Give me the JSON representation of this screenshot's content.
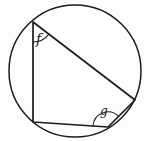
{
  "figure": {
    "colors": {
      "line": "#1c1c1c",
      "background": "#fdfdfd"
    },
    "circle": {
      "cx": 75,
      "cy": 71,
      "r": 66
    },
    "quadrilateral": {
      "points": [
        [
          33,
          22
        ],
        [
          33,
          122
        ],
        [
          108,
          127
        ],
        [
          135,
          100
        ]
      ]
    },
    "angle_arcs": {
      "f": {
        "path": "M 33 42 A 20 20 0 0 0 48.9 34.1"
      },
      "g": {
        "path": "M 93.0 126.0 A 15 15 0 0 1 118.6 116.4"
      }
    },
    "labels": {
      "f": {
        "text": "f",
        "x": 36,
        "y": 44,
        "size": 14
      },
      "g": {
        "text": "g",
        "x": 100,
        "y": 115,
        "size": 12
      }
    }
  }
}
